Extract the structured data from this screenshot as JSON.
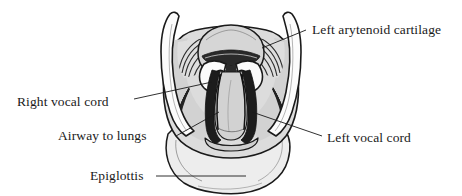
{
  "figure": {
    "kind": "anatomical-line-drawing",
    "background_color": "#ffffff",
    "ink_color": "#1a1a1a",
    "fill_light": "#e8e8e8",
    "fill_mid": "#c9c9c9",
    "fill_dark": "#222222",
    "fill_white": "#fdfdfd"
  },
  "labels": [
    {
      "id": "left-arytenoid-cartilage",
      "text": "Left arytenoid cartilage",
      "side": "right"
    },
    {
      "id": "right-vocal-cord",
      "text": "Right vocal cord",
      "side": "left"
    },
    {
      "id": "airway-to-lungs",
      "text": "Airway to lungs",
      "side": "left"
    },
    {
      "id": "left-vocal-cord",
      "text": "Left vocal cord",
      "side": "right"
    },
    {
      "id": "epiglottis",
      "text": "Epiglottis",
      "side": "left"
    }
  ]
}
